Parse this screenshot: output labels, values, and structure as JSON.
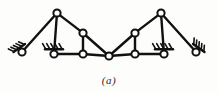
{
  "figure": {
    "caption": "(a)",
    "type": "structural-truss-diagram",
    "background_color": "#fdfdfc",
    "ink_color": "#111111",
    "joint_fill_color": "#ffffff",
    "width": 218,
    "height": 93
  },
  "geometry": {
    "joint_radius": 3.6,
    "member_stroke_width": 2.4,
    "joint_stroke_width": 2.0,
    "hatch_stroke_width": 1.6
  },
  "joints": [
    {
      "id": "L0",
      "name": "left-anchor-pin",
      "x": 22,
      "y": 52,
      "kind": "pin-support"
    },
    {
      "id": "L1",
      "name": "left-base-joint",
      "x": 54,
      "y": 54,
      "kind": "pin-support"
    },
    {
      "id": "L2",
      "name": "left-apex-joint",
      "x": 57,
      "y": 13,
      "kind": "free"
    },
    {
      "id": "L3",
      "name": "left-inner-top-joint",
      "x": 83,
      "y": 33,
      "kind": "free"
    },
    {
      "id": "L4",
      "name": "left-inner-base-joint",
      "x": 83,
      "y": 54,
      "kind": "free"
    },
    {
      "id": "C0",
      "name": "center-crown-hinge",
      "x": 109,
      "y": 56,
      "kind": "free"
    },
    {
      "id": "R4",
      "name": "right-inner-base-joint",
      "x": 135,
      "y": 54,
      "kind": "free"
    },
    {
      "id": "R3",
      "name": "right-inner-top-joint",
      "x": 135,
      "y": 33,
      "kind": "free"
    },
    {
      "id": "R2",
      "name": "right-apex-joint",
      "x": 161,
      "y": 13,
      "kind": "free"
    },
    {
      "id": "R1",
      "name": "right-base-joint",
      "x": 164,
      "y": 54,
      "kind": "pin-support"
    },
    {
      "id": "R0",
      "name": "right-anchor-pin",
      "x": 196,
      "y": 52,
      "kind": "pin-support"
    }
  ],
  "members": [
    {
      "name": "member-L0-L2",
      "from": "L0",
      "to": "L2"
    },
    {
      "name": "member-L2-L1",
      "from": "L2",
      "to": "L1"
    },
    {
      "name": "member-L2-L3",
      "from": "L2",
      "to": "L3"
    },
    {
      "name": "member-L3-C0",
      "from": "L3",
      "to": "C0"
    },
    {
      "name": "member-L3-L4",
      "from": "L3",
      "to": "L4"
    },
    {
      "name": "member-L1-L4",
      "from": "L1",
      "to": "L4"
    },
    {
      "name": "member-L4-C0",
      "from": "L4",
      "to": "C0"
    },
    {
      "name": "member-C0-R4",
      "from": "C0",
      "to": "R4"
    },
    {
      "name": "member-C0-R3",
      "from": "C0",
      "to": "R3"
    },
    {
      "name": "member-R3-R4",
      "from": "R3",
      "to": "R4"
    },
    {
      "name": "member-R4-R1",
      "from": "R4",
      "to": "R1"
    },
    {
      "name": "member-R3-R2",
      "from": "R3",
      "to": "R2"
    },
    {
      "name": "member-R2-R1",
      "from": "R2",
      "to": "R1"
    },
    {
      "name": "member-R2-R0",
      "from": "R2",
      "to": "R0"
    }
  ],
  "supports": [
    {
      "name": "support-left-anchor",
      "joint": "L0",
      "style": "inclined-hatched-pin",
      "angle_deg": 235
    },
    {
      "name": "support-left-base",
      "joint": "L1",
      "style": "ground-hatched-pin",
      "angle_deg": 270
    },
    {
      "name": "support-right-base",
      "joint": "R1",
      "style": "ground-hatched-pin",
      "angle_deg": 270
    },
    {
      "name": "support-right-anchor",
      "joint": "R0",
      "style": "inclined-hatched-pin",
      "angle_deg": 305
    }
  ]
}
